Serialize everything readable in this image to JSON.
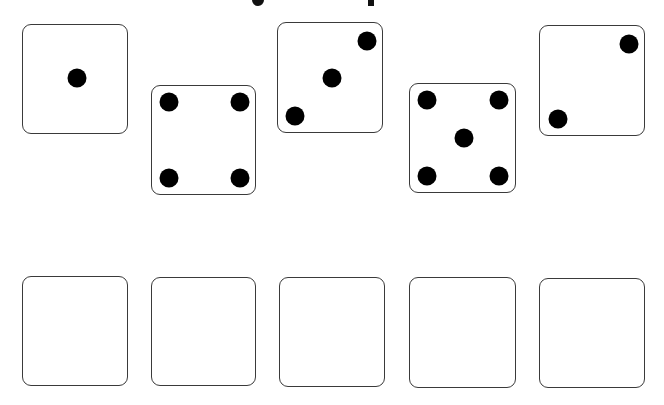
{
  "title": {
    "visible_text": "",
    "note_cutoff": true,
    "descenders": [
      {
        "x": 252,
        "width": 12
      },
      {
        "x": 368,
        "width": 6
      }
    ]
  },
  "colors": {
    "border": "#3a3a3a",
    "pip": "#000000",
    "background": "#ffffff"
  },
  "dice": [
    {
      "value": 1,
      "box": {
        "x": 22,
        "y": 24,
        "w": 106,
        "h": 110
      },
      "pips": [
        [
          54,
          53
        ]
      ]
    },
    {
      "value": 4,
      "box": {
        "x": 151,
        "y": 85,
        "w": 105,
        "h": 110
      },
      "pips": [
        [
          17,
          16
        ],
        [
          88,
          16
        ],
        [
          17,
          92
        ],
        [
          88,
          92
        ]
      ]
    },
    {
      "value": 3,
      "box": {
        "x": 277,
        "y": 22,
        "w": 106,
        "h": 111
      },
      "pips": [
        [
          89,
          18
        ],
        [
          54,
          55
        ],
        [
          17,
          93
        ]
      ]
    },
    {
      "value": 5,
      "box": {
        "x": 409,
        "y": 83,
        "w": 107,
        "h": 110
      },
      "pips": [
        [
          17,
          16
        ],
        [
          89,
          16
        ],
        [
          54,
          54
        ],
        [
          17,
          92
        ],
        [
          89,
          92
        ]
      ]
    },
    {
      "value": 2,
      "box": {
        "x": 539,
        "y": 25,
        "w": 106,
        "h": 111
      },
      "pips": [
        [
          89,
          18
        ],
        [
          18,
          93
        ]
      ]
    }
  ],
  "slots": [
    {
      "x": 22,
      "y": 276,
      "w": 106,
      "h": 110
    },
    {
      "x": 151,
      "y": 277,
      "w": 105,
      "h": 109
    },
    {
      "x": 279,
      "y": 277,
      "w": 106,
      "h": 110
    },
    {
      "x": 409,
      "y": 277,
      "w": 107,
      "h": 111
    },
    {
      "x": 539,
      "y": 278,
      "w": 106,
      "h": 110
    }
  ]
}
